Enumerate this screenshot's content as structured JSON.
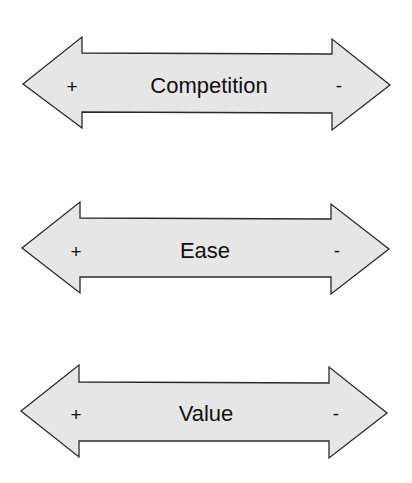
{
  "diagram": {
    "arrows": [
      {
        "label": "Competition",
        "left_sign": "+",
        "right_sign": "-"
      },
      {
        "label": "Ease",
        "left_sign": "+",
        "right_sign": "-"
      },
      {
        "label": "Value",
        "left_sign": "+",
        "right_sign": "-"
      }
    ],
    "colors": {
      "fill": "#e6e6e6",
      "stroke": "#2a2a2a",
      "text": "#111111"
    }
  }
}
